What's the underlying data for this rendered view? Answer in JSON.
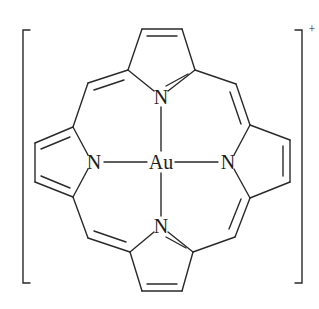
{
  "diagram": {
    "type": "chemical-structure",
    "metal_center": {
      "label": "Au",
      "x": 161,
      "y": 162
    },
    "nitrogens": [
      {
        "id": "n_top",
        "label": "N",
        "x": 161,
        "y": 97
      },
      {
        "id": "n_left",
        "label": "N",
        "x": 94,
        "y": 162
      },
      {
        "id": "n_right",
        "label": "N",
        "x": 228,
        "y": 162
      },
      {
        "id": "n_bottom",
        "label": "N",
        "x": 161,
        "y": 226
      }
    ],
    "charge": {
      "label": "+",
      "x": 312,
      "y": 33
    },
    "brackets": {
      "left_x": 23,
      "right_x": 302,
      "top_y": 30,
      "bottom_y": 283,
      "serif": 7
    },
    "top_cut_text": "",
    "colors": {
      "line": "#2a2a2a",
      "text": "#1e1e1e",
      "background": "#ffffff"
    }
  }
}
